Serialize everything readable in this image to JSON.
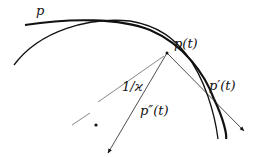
{
  "labels": {
    "curve": "p",
    "point": "p(t)",
    "tangent": "p′(t)",
    "second_derivative": "p″(t)",
    "radius": "1/ϰ"
  }
}
